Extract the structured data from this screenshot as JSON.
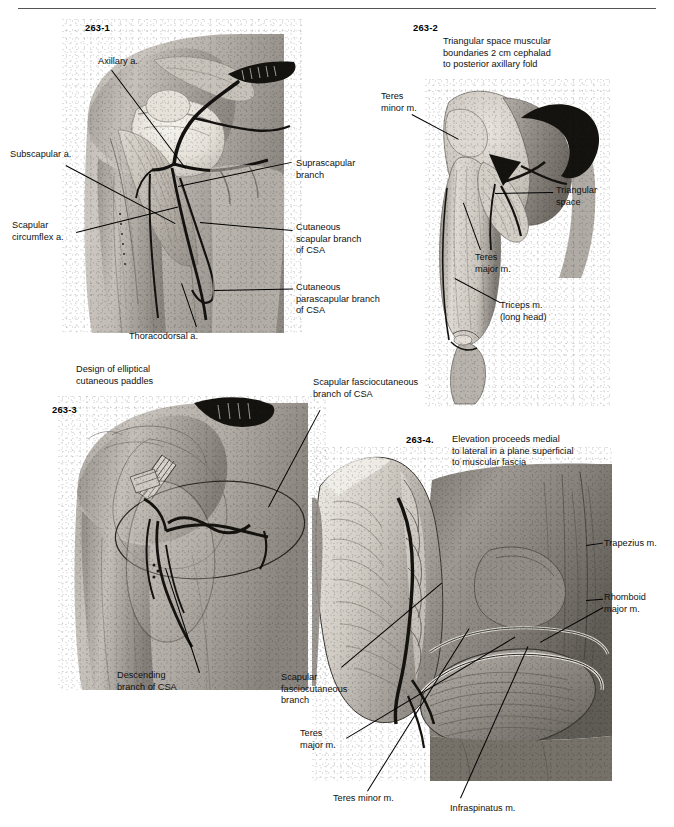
{
  "running_head": {
    "text": "",
    "page_number": ""
  },
  "figures": [
    {
      "id": "263-1",
      "number": "263-1",
      "caption": "",
      "labels": [
        {
          "name": "axillary-artery",
          "text": "Axillary a."
        },
        {
          "name": "subscapular-artery",
          "text": "Subscapular a."
        },
        {
          "name": "scapular-circumflex-artery",
          "text": "Scapular\ncircumflex a."
        },
        {
          "name": "thoracodorsal-artery",
          "text": "Thoracodorsal a."
        },
        {
          "name": "suprascapular-branch",
          "text": "Suprascapular\nbranch"
        },
        {
          "name": "cutaneous-scapular-branch",
          "text": "Cutaneous\nscapular branch\nof CSA"
        },
        {
          "name": "cutaneous-parascapular-branch",
          "text": "Cutaneous\nparascapular branch\nof CSA"
        }
      ]
    },
    {
      "id": "263-2",
      "number": "263-2",
      "caption": "Triangular space muscular\nboundaries 2 cm cephalad\nto posterior axillary fold",
      "labels": [
        {
          "name": "teres-minor-muscle",
          "text": "Teres\nminor m."
        },
        {
          "name": "triangular-space",
          "text": "Triangular\nspace"
        },
        {
          "name": "teres-major-muscle",
          "text": "Teres\nmajor m."
        },
        {
          "name": "triceps-muscle",
          "text": "Triceps m.\n(long head)"
        }
      ]
    },
    {
      "id": "263-3",
      "number": "263-3",
      "caption": "Design of elliptical\ncutaneous paddles",
      "labels": [
        {
          "name": "scapular-fasciocutaneous-branch-csa",
          "text": "Scapular fasciocutaneous\nbranch of CSA"
        },
        {
          "name": "descending-branch-csa",
          "text": "Descending\nbranch of CSA"
        }
      ]
    },
    {
      "id": "263-4",
      "number": "263-4.",
      "caption": "Elevation proceeds medial\nto lateral in a plane superficial\nto muscular fascia",
      "labels": [
        {
          "name": "trapezius-muscle",
          "text": "Trapezius m."
        },
        {
          "name": "rhomboid-major-muscle",
          "text": "Rhomboid\nmajor m."
        },
        {
          "name": "scapular-fasciocutaneous-branch",
          "text": "Scapular\nfasciocutaneous\nbranch"
        },
        {
          "name": "teres-major-muscle",
          "text": "Teres\nmajor m."
        },
        {
          "name": "teres-minor-muscle",
          "text": "Teres minor m."
        },
        {
          "name": "infraspinatus-muscle",
          "text": "Infraspinatus m."
        }
      ]
    }
  ],
  "colors": {
    "ink": "#111111",
    "rule": "#555555",
    "vessel": "#111111",
    "skin_light": "#d8d5d0",
    "skin_mid": "#a9a49e",
    "skin_dark": "#6d6862",
    "bone": "#efece6",
    "muscle": "#cfc9c1"
  }
}
